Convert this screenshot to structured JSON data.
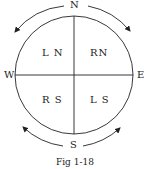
{
  "diagram": {
    "compass": {
      "north": "N",
      "south": "S",
      "east": "E",
      "west": "W"
    },
    "quadrants": {
      "top_left": "L N",
      "top_right": "RN",
      "bottom_left": "R S",
      "bottom_right": "L S"
    },
    "arrows": [
      {
        "position": "top-left",
        "direction": "away from N toward W"
      },
      {
        "position": "top-right",
        "direction": "away from N toward E"
      },
      {
        "position": "bottom-left",
        "direction": "away from S toward W"
      },
      {
        "position": "bottom-right",
        "direction": "away from S toward E"
      }
    ],
    "caption": "Fig 1-18",
    "colors": {
      "line": "#222222",
      "background": "#ffffff"
    }
  }
}
